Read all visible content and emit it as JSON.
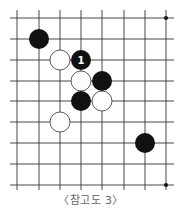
{
  "diagram": {
    "caption": "〈참고도 3〉",
    "grid": {
      "x_lines": [
        17,
        39,
        60,
        81,
        102,
        124,
        145,
        166
      ],
      "y_lines": [
        18,
        39,
        60,
        81,
        101,
        122,
        143,
        164,
        185
      ],
      "x_extent": [
        10,
        174
      ],
      "y_extent": [
        10,
        190
      ],
      "line_color": "#333333"
    },
    "star_points": [
      {
        "col": 7,
        "row": 0
      },
      {
        "col": 7,
        "row": 8
      }
    ],
    "stones": [
      {
        "color": "black",
        "col": 1,
        "row": 1,
        "label": ""
      },
      {
        "color": "white",
        "col": 2,
        "row": 2,
        "label": ""
      },
      {
        "color": "black",
        "col": 3,
        "row": 2,
        "label": "1"
      },
      {
        "color": "white",
        "col": 3,
        "row": 3,
        "label": ""
      },
      {
        "color": "black",
        "col": 4,
        "row": 3,
        "label": ""
      },
      {
        "color": "black",
        "col": 3,
        "row": 4,
        "label": ""
      },
      {
        "color": "white",
        "col": 4,
        "row": 4,
        "label": ""
      },
      {
        "color": "white",
        "col": 2,
        "row": 5,
        "label": ""
      },
      {
        "color": "black",
        "col": 6,
        "row": 6,
        "label": ""
      }
    ],
    "colors": {
      "black_stone": "#111111",
      "white_stone": "#ffffff",
      "white_outline": "#333333",
      "label": "#ffffff"
    }
  }
}
